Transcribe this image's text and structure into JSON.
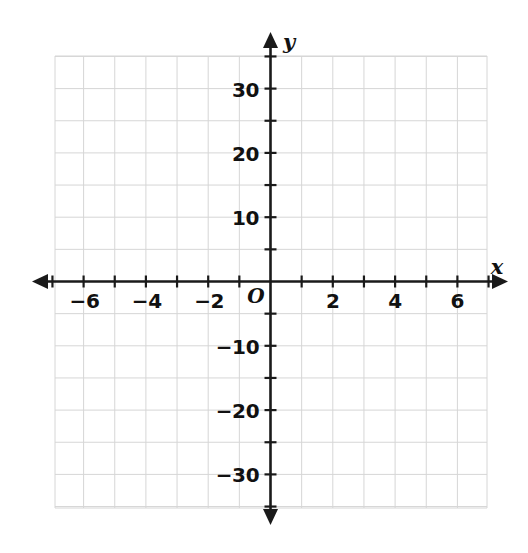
{
  "chart_data": {
    "type": "scatter",
    "title": "",
    "subtitle": "",
    "xlabel": "x",
    "ylabel": "y",
    "origin_label": "O",
    "xlim": [
      -7,
      7
    ],
    "ylim": [
      -35,
      35
    ],
    "x_tick_step": 1,
    "x_labeled_step": 2,
    "y_tick_step": 5,
    "y_labeled_step": 10,
    "x_tick_labels": [
      "−6",
      "−4",
      "−2",
      "2",
      "4",
      "6"
    ],
    "x_tick_values": [
      -6,
      -4,
      -2,
      2,
      4,
      6
    ],
    "y_tick_labels": [
      "30",
      "20",
      "10",
      "−10",
      "−20",
      "−30"
    ],
    "y_tick_values": [
      30,
      20,
      10,
      -10,
      -20,
      -30
    ],
    "series": [],
    "values": [],
    "categories": [],
    "grid": true,
    "grid_color": "#d6d6d6",
    "axis_color": "#1a1a1a",
    "legend": "none",
    "annotations": []
  },
  "axes": {
    "x_axis_label": "x",
    "y_axis_label": "y",
    "origin": "O"
  },
  "x_labels": [
    {
      "text": "−6",
      "value": -6
    },
    {
      "text": "−4",
      "value": -4
    },
    {
      "text": "−2",
      "value": -2
    },
    {
      "text": "2",
      "value": 2
    },
    {
      "text": "4",
      "value": 4
    },
    {
      "text": "6",
      "value": 6
    }
  ],
  "y_labels": [
    {
      "text": "30",
      "value": 30
    },
    {
      "text": "20",
      "value": 20
    },
    {
      "text": "10",
      "value": 10
    },
    {
      "text": "−10",
      "value": -10
    },
    {
      "text": "−20",
      "value": -20
    },
    {
      "text": "−30",
      "value": -30
    }
  ],
  "colors": {
    "background": "#ffffff",
    "grid": "#d6d6d6",
    "axis": "#1a1a1a",
    "text": "#111111"
  }
}
